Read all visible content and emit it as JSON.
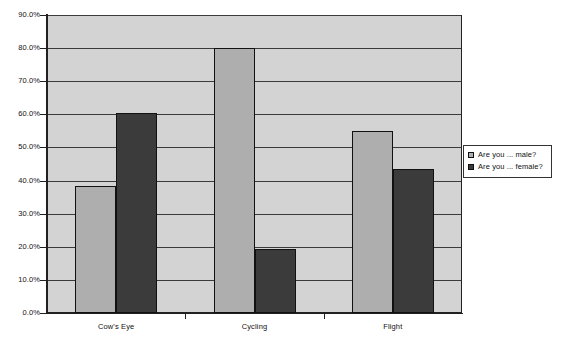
{
  "chart_data": {
    "type": "bar",
    "title": "",
    "subtitle": "",
    "xlabel": "",
    "ylabel": "",
    "categories": [
      "Cow's Eye",
      "Cycling",
      "Flight"
    ],
    "series": [
      {
        "name": "Are you ... male?",
        "key": "male",
        "color": "#aeaeae",
        "values": [
          38.5,
          80.0,
          55.0
        ]
      },
      {
        "name": "Are you ... female?",
        "key": "female",
        "color": "#3b3b3b",
        "values": [
          60.5,
          19.3,
          43.5
        ]
      }
    ],
    "ylim": [
      0,
      90
    ],
    "y_tick_step": 10,
    "y_tick_labels": [
      "0.0%",
      "10.0%",
      "20.0%",
      "30.0%",
      "40.0%",
      "50.0%",
      "60.0%",
      "70.0%",
      "80.0%",
      "90.0%"
    ],
    "y_tick_values": [
      0,
      10,
      20,
      30,
      40,
      50,
      60,
      70,
      80,
      90
    ],
    "grid": true,
    "grid_axis": "y",
    "legend_position": "right",
    "plot_background": "#d3d3d3",
    "axis_color": "#202020",
    "bar_border_color": "#111111"
  },
  "legend": {
    "items": [
      {
        "label": "Are you ... male?"
      },
      {
        "label": "Are you ... female?"
      }
    ]
  }
}
